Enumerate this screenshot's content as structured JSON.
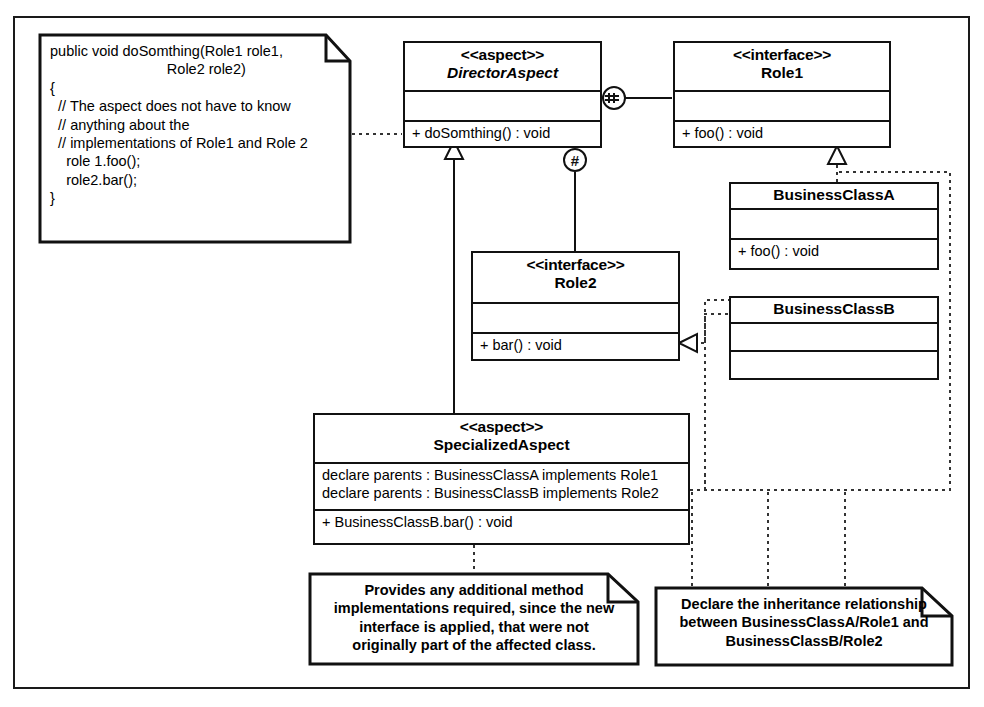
{
  "diagram": {
    "frame": {
      "border_color": "#1a1a1a"
    }
  },
  "notes": {
    "code_note": {
      "text": "public void doSomthing(Role1 role1,\n                             Role2 role2)\n{\n  // The aspect does not have to know\n  // anything about the\n  // implementations of Role1 and Role 2\n    role 1.foo();\n    role2.bar();\n}"
    },
    "provides_note": {
      "text": "Provides any additional method\nimplementations required, since the new\ninterface is applied, that were not\noriginally part of the affected class."
    },
    "declare_note": {
      "text": "Declare the inheritance relationship\nbetween BusinessClassA/Role1 and\nBusinessClassB/Role2"
    }
  },
  "classes": {
    "director_aspect": {
      "stereotype": "<<aspect>>",
      "name": "DirectorAspect",
      "attributes": "",
      "operations": "+ doSomthing() : void"
    },
    "role1": {
      "stereotype": "<<interface>>",
      "name": "Role1",
      "attributes": "",
      "operations": "+ foo() : void"
    },
    "role2": {
      "stereotype": "<<interface>>",
      "name": "Role2",
      "attributes": "",
      "operations": "+ bar() : void"
    },
    "business_class_a": {
      "name": "BusinessClassA",
      "attributes": "",
      "operations": "+ foo() : void"
    },
    "business_class_b": {
      "name": "BusinessClassB",
      "attributes": "",
      "operations": ""
    },
    "specialized_aspect": {
      "stereotype": "<<aspect>>",
      "name": "SpecializedAspect",
      "declarations_line1": "declare parents : BusinessClassA implements Role1",
      "declarations_line2": "declare parents : BusinessClassB implements Role2",
      "operations": "+ BusinessClassB.bar() : void"
    }
  },
  "markers": {
    "crosscut_marker": "‡",
    "advice_marker": "#"
  }
}
